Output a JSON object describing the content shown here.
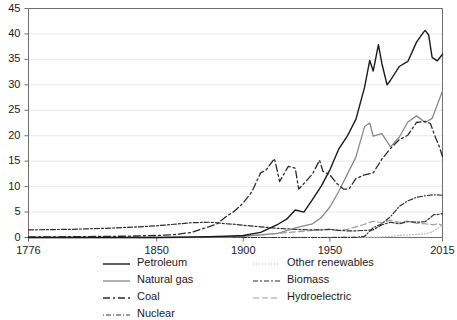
{
  "chart_data": {
    "type": "line",
    "title": "",
    "xlabel": "",
    "ylabel": "",
    "xlim": [
      1776,
      2015
    ],
    "ylim": [
      0,
      45
    ],
    "grid": true,
    "legend_position": "bottom",
    "xticks": [
      "1776",
      "1850",
      "1900",
      "1950",
      "2015"
    ],
    "xtick_values": [
      1776,
      1850,
      1900,
      1950,
      2015
    ],
    "yticks": [
      "0",
      "5",
      "10",
      "15",
      "20",
      "25",
      "30",
      "35",
      "40",
      "45"
    ],
    "ytick_values": [
      0,
      5,
      10,
      15,
      20,
      25,
      30,
      35,
      40,
      45
    ],
    "series": [
      {
        "name": "Petroleum",
        "color": "#1a1a1a",
        "dash": "none",
        "width": 1.4,
        "x": [
          1776,
          1850,
          1860,
          1870,
          1880,
          1890,
          1900,
          1910,
          1920,
          1925,
          1930,
          1935,
          1940,
          1945,
          1950,
          1955,
          1960,
          1965,
          1970,
          1973,
          1975,
          1978,
          1980,
          1983,
          1985,
          1990,
          1995,
          2000,
          2004,
          2005,
          2007,
          2009,
          2012,
          2015
        ],
        "values": [
          0,
          0,
          0.05,
          0.1,
          0.15,
          0.25,
          0.4,
          1.0,
          2.6,
          3.6,
          5.4,
          5.0,
          7.5,
          10.1,
          13.3,
          17.3,
          19.9,
          23.2,
          29.5,
          34.8,
          32.7,
          37.9,
          34.2,
          30.0,
          30.9,
          33.6,
          34.6,
          38.4,
          40.3,
          40.7,
          39.8,
          35.4,
          34.7,
          36.0
        ]
      },
      {
        "name": "Natural gas",
        "color": "#8a8a8a",
        "dash": "none",
        "width": 1.3,
        "x": [
          1776,
          1850,
          1880,
          1890,
          1900,
          1910,
          1920,
          1930,
          1940,
          1945,
          1950,
          1955,
          1960,
          1965,
          1970,
          1973,
          1975,
          1980,
          1985,
          1990,
          1995,
          2000,
          2005,
          2009,
          2012,
          2015
        ],
        "values": [
          0,
          0,
          0.02,
          0.1,
          0.25,
          0.5,
          0.8,
          1.9,
          2.7,
          3.9,
          6.0,
          9.0,
          12.4,
          15.8,
          21.8,
          22.5,
          19.9,
          20.4,
          17.8,
          19.7,
          22.7,
          23.9,
          22.6,
          23.4,
          26.1,
          28.8
        ]
      },
      {
        "name": "Coal",
        "color": "#2a2a2a",
        "dash": "7,3,2,3",
        "width": 1.3,
        "x": [
          1776,
          1800,
          1830,
          1850,
          1860,
          1870,
          1880,
          1885,
          1890,
          1895,
          1900,
          1905,
          1910,
          1913,
          1918,
          1921,
          1926,
          1930,
          1932,
          1935,
          1940,
          1944,
          1946,
          1950,
          1954,
          1958,
          1961,
          1965,
          1970,
          1975,
          1980,
          1985,
          1990,
          1995,
          2000,
          2005,
          2008,
          2011,
          2013,
          2015
        ],
        "values": [
          0.1,
          0.15,
          0.25,
          0.4,
          0.55,
          1.0,
          2.1,
          2.7,
          4.1,
          5.2,
          6.8,
          9.0,
          12.7,
          13.2,
          15.5,
          11.0,
          14.0,
          13.6,
          9.5,
          10.6,
          12.5,
          15.2,
          13.0,
          12.3,
          10.6,
          9.5,
          9.5,
          11.6,
          12.3,
          12.7,
          15.4,
          17.5,
          19.2,
          20.1,
          22.6,
          22.8,
          22.4,
          19.6,
          18.0,
          15.9
        ]
      },
      {
        "name": "Nuclear",
        "color": "#333333",
        "dash": "1,2,5,2",
        "width": 1.2,
        "x": [
          1776,
          1950,
          1957,
          1960,
          1965,
          1970,
          1975,
          1980,
          1985,
          1990,
          1995,
          2000,
          2005,
          2010,
          2015
        ],
        "values": [
          0,
          0,
          0.01,
          0.01,
          0.04,
          0.24,
          1.9,
          2.7,
          4.1,
          6.1,
          7.2,
          7.9,
          8.2,
          8.4,
          8.3
        ]
      },
      {
        "name": "Other renewables",
        "color": "#b9b9b9",
        "dash": "1,2",
        "width": 1.2,
        "x": [
          1776,
          1900,
          1950,
          1960,
          1970,
          1980,
          1985,
          1990,
          1995,
          2000,
          2005,
          2008,
          2010,
          2012,
          2015
        ],
        "values": [
          0,
          0,
          0.01,
          0.02,
          0.03,
          0.1,
          0.2,
          0.4,
          0.5,
          0.6,
          0.7,
          1.0,
          1.3,
          1.8,
          2.5
        ]
      },
      {
        "name": "Biomass",
        "color": "#2d2d2d",
        "dash": "5,2,2,2",
        "width": 1.2,
        "x": [
          1776,
          1800,
          1820,
          1840,
          1850,
          1860,
          1870,
          1880,
          1885,
          1890,
          1895,
          1900,
          1910,
          1920,
          1930,
          1940,
          1945,
          1950,
          1955,
          1960,
          1965,
          1970,
          1975,
          1980,
          1985,
          1990,
          1995,
          2000,
          2005,
          2008,
          2010,
          2012,
          2015
        ],
        "values": [
          1.5,
          1.6,
          1.8,
          2.1,
          2.3,
          2.6,
          2.9,
          3.0,
          2.9,
          2.7,
          2.6,
          2.4,
          2.1,
          1.8,
          1.6,
          1.5,
          1.5,
          1.6,
          1.4,
          1.3,
          1.3,
          1.4,
          1.5,
          2.5,
          3.0,
          2.7,
          3.1,
          3.0,
          3.1,
          3.9,
          4.5,
          4.5,
          4.7
        ]
      },
      {
        "name": "Hydroelectric",
        "color": "#9d9d9d",
        "dash": "6,3",
        "width": 1.2,
        "x": [
          1776,
          1880,
          1890,
          1900,
          1910,
          1920,
          1930,
          1940,
          1945,
          1950,
          1955,
          1960,
          1965,
          1970,
          1975,
          1980,
          1985,
          1990,
          1995,
          2000,
          2005,
          2010,
          2012,
          2015
        ],
        "values": [
          0,
          0,
          0.05,
          0.25,
          0.5,
          0.8,
          1.1,
          1.4,
          1.5,
          1.6,
          1.4,
          1.6,
          2.1,
          2.6,
          3.2,
          2.9,
          3.4,
          3.0,
          3.2,
          2.8,
          2.7,
          2.5,
          2.7,
          2.4
        ]
      }
    ]
  },
  "legend": {
    "left_column": [
      {
        "label": "Petroleum",
        "series": "Petroleum"
      },
      {
        "label": "Natural gas",
        "series": "Natural gas"
      },
      {
        "label": "Coal",
        "series": "Coal"
      },
      {
        "label": "Nuclear",
        "series": "Nuclear"
      }
    ],
    "right_column": [
      {
        "label": "Other renewables",
        "series": "Other renewables"
      },
      {
        "label": "Biomass",
        "series": "Biomass"
      },
      {
        "label": "Hydroelectric",
        "series": "Hydroelectric"
      }
    ]
  },
  "style": {
    "axis_color": "#6f6f6f",
    "grid_color": "#e8e8e8",
    "background": "#ffffff",
    "tick_text_color": "#1b1b1b"
  }
}
